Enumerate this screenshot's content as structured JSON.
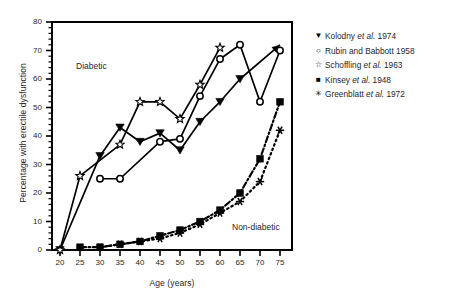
{
  "chart_data": {
    "type": "line",
    "title": "",
    "xlabel": "Age (years)",
    "ylabel": "Percentage with erectile dysfunction",
    "xlim": [
      18,
      78
    ],
    "ylim": [
      0,
      80
    ],
    "xticks": [
      20,
      25,
      30,
      35,
      40,
      45,
      50,
      55,
      60,
      65,
      70,
      75
    ],
    "yticks": [
      0,
      10,
      20,
      30,
      40,
      50,
      60,
      70,
      80
    ],
    "grid": false,
    "legend_position": "right",
    "annotations": [
      {
        "text": "Diabetic",
        "x": 27,
        "y": 57
      },
      {
        "text": "Non-diabetic",
        "x": 63,
        "y": 9
      }
    ],
    "groups": [
      {
        "name": "Diabetic",
        "line_style": "solid"
      },
      {
        "name": "Non-diabetic",
        "line_style": "dotted"
      }
    ],
    "series": [
      {
        "name": "Kolodny et al. 1974",
        "marker": "triangle-down",
        "group": "Diabetic",
        "line_style": "solid",
        "x": [
          20,
          30,
          35,
          40,
          45,
          50,
          55,
          60,
          65,
          75
        ],
        "y": [
          0,
          33,
          43,
          38,
          41,
          35,
          45,
          52,
          60,
          72
        ]
      },
      {
        "name": "Rubin and Babbott 1958",
        "marker": "circle-open",
        "group": "Diabetic",
        "line_style": "solid",
        "x": [
          30,
          35,
          45,
          50,
          55,
          60,
          65,
          70,
          75
        ],
        "y": [
          25,
          25,
          38,
          39,
          54,
          67,
          72,
          52,
          70
        ]
      },
      {
        "name": "Schoffling et al. 1963",
        "marker": "star-open",
        "group": "Diabetic",
        "line_style": "solid",
        "x": [
          20,
          25,
          35,
          40,
          45,
          50,
          55,
          60
        ],
        "y": [
          0,
          26,
          37,
          52,
          52,
          46,
          58,
          71
        ]
      },
      {
        "name": "Kinsey et al. 1948",
        "marker": "square-filled",
        "group": "Non-diabetic",
        "line_style": "dash-dot",
        "x": [
          25,
          30,
          35,
          40,
          45,
          50,
          55,
          60,
          65,
          70,
          75
        ],
        "y": [
          1,
          1,
          2,
          3,
          5,
          7,
          10,
          14,
          20,
          32,
          52
        ]
      },
      {
        "name": "Greenblatt et al. 1972",
        "marker": "asterisk",
        "group": "Non-diabetic",
        "line_style": "dotted",
        "x": [
          30,
          35,
          40,
          45,
          50,
          55,
          60,
          65,
          70,
          75
        ],
        "y": [
          1,
          2,
          3,
          4,
          6,
          9,
          13,
          17,
          24,
          42
        ]
      }
    ]
  },
  "legend": {
    "items": [
      {
        "marker": "▼",
        "author": "Kolodny",
        "etal": "et al.",
        "year": "1974"
      },
      {
        "marker": "○",
        "author": "Rubin and Babbott",
        "etal": "",
        "year": "1958"
      },
      {
        "marker": "☆",
        "author": "Schoffling",
        "etal": "et al.",
        "year": "1963"
      },
      {
        "marker": "■",
        "author": "Kinsey",
        "etal": "et al.",
        "year": "1948"
      },
      {
        "marker": "✳",
        "author": "Greenblatt",
        "etal": "et al.",
        "year": "1972"
      }
    ]
  },
  "colors": {
    "ink": "#000000",
    "background": "#ffffff",
    "text": "#1f1f1f"
  }
}
